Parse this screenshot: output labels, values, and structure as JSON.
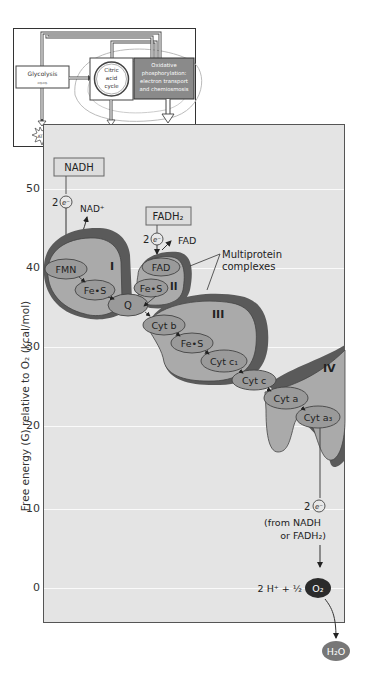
{
  "inset": {
    "glycolysis": "Glycolysis",
    "citric_acid_cycle": [
      "Citric",
      "acid",
      "cycle"
    ],
    "oxidative": [
      "Oxidative",
      "phosphorylation:",
      "electron transport",
      "and chemiosmosis"
    ],
    "atp_labels": [
      "ATP",
      "ATP",
      "ATP"
    ]
  },
  "axis": {
    "ylabel": "Free energy (G) relative to O₂ (kcal/mol)",
    "ticks": [
      {
        "label": "50",
        "y": 189
      },
      {
        "label": "40",
        "y": 268
      },
      {
        "label": "30",
        "y": 347
      },
      {
        "label": "20",
        "y": 426
      },
      {
        "label": "10",
        "y": 509
      },
      {
        "label": "0",
        "y": 588
      }
    ]
  },
  "diagram": {
    "nadh": "NADH",
    "nad_plus": "NAD⁺",
    "fadh2": "FADH₂",
    "fad_out": "FAD",
    "electron_count": "2",
    "electron_symbol": "e⁻",
    "complex_labels": [
      "I",
      "II",
      "III",
      "IV"
    ],
    "carriers": {
      "fmn": "FMN",
      "fes1": "Fe•S",
      "fad": "FAD",
      "fes2": "Fe•S",
      "q": "Q",
      "cytb": "Cyt b",
      "fes3": "Fe•S",
      "cytc1": "Cyt c₁",
      "cytc": "Cyt c",
      "cyta": "Cyt a",
      "cyta3": "Cyt a₃"
    },
    "multiprotein_label": [
      "Multiprotein",
      "complexes"
    ],
    "from_label": [
      "(from NADH",
      "or FADH₂)"
    ],
    "oxygen_eq": "2 H⁺ + ½",
    "o2": "O₂",
    "h2o": "H₂O"
  },
  "colors": {
    "panel_bg": "#e4e4e4",
    "complex_fill": "#a9a9a9",
    "complex_dark": "#5a5a5a",
    "carrier_fill": "#9a9a9a",
    "o2_fill": "#2b2b2b",
    "h2o_fill": "#777777",
    "oxidative_box": "#8a8a8a"
  }
}
